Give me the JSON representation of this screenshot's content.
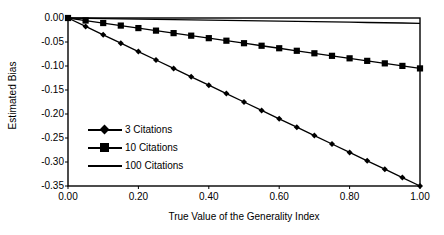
{
  "chart_data": {
    "type": "line",
    "title": "",
    "xlabel": "True Value of the Generality Index",
    "ylabel": "Estimated Bias",
    "xlim": [
      0.0,
      1.0
    ],
    "ylim": [
      -0.35,
      0.0
    ],
    "xticks": [
      "0.00",
      "0.20",
      "0.40",
      "0.60",
      "0.80",
      "1.00"
    ],
    "xtick_values": [
      0.0,
      0.2,
      0.4,
      0.6,
      0.8,
      1.0
    ],
    "yticks": [
      "0.00",
      "-0.05",
      "-0.10",
      "-0.15",
      "-0.20",
      "-0.25",
      "-0.30",
      "-0.35"
    ],
    "ytick_values": [
      0.0,
      -0.05,
      -0.1,
      -0.15,
      -0.2,
      -0.25,
      -0.3,
      -0.35
    ],
    "grid": false,
    "legend_position": "inside-lower-left",
    "x": [
      0.0,
      0.05,
      0.1,
      0.15,
      0.2,
      0.25,
      0.3,
      0.35,
      0.4,
      0.45,
      0.5,
      0.55,
      0.6,
      0.65,
      0.7,
      0.75,
      0.8,
      0.85,
      0.9,
      0.95,
      1.0
    ],
    "series": [
      {
        "name": "3 Citations",
        "marker": "diamond",
        "color": "#000000",
        "values": [
          0.0,
          -0.0175,
          -0.035,
          -0.0525,
          -0.07,
          -0.0875,
          -0.105,
          -0.1225,
          -0.14,
          -0.1575,
          -0.175,
          -0.1925,
          -0.21,
          -0.2275,
          -0.245,
          -0.2625,
          -0.28,
          -0.2975,
          -0.315,
          -0.3325,
          -0.35
        ]
      },
      {
        "name": "10 Citations",
        "marker": "square",
        "color": "#000000",
        "values": [
          0.0,
          -0.0053,
          -0.0105,
          -0.0158,
          -0.021,
          -0.0263,
          -0.0315,
          -0.0368,
          -0.042,
          -0.0473,
          -0.0525,
          -0.0578,
          -0.063,
          -0.0683,
          -0.0735,
          -0.0788,
          -0.084,
          -0.0893,
          -0.0945,
          -0.0998,
          -0.105
        ]
      },
      {
        "name": "100 Citations",
        "marker": "none",
        "color": "#000000",
        "values": [
          0.0,
          -0.00055,
          -0.0011,
          -0.00165,
          -0.0022,
          -0.00275,
          -0.0033,
          -0.00385,
          -0.0044,
          -0.00495,
          -0.0055,
          -0.00605,
          -0.0066,
          -0.00715,
          -0.0077,
          -0.00825,
          -0.0088,
          -0.00935,
          -0.0099,
          -0.01045,
          -0.011
        ]
      }
    ]
  },
  "legend": {
    "items": [
      {
        "label": "3 Citations"
      },
      {
        "label": "10 Citations"
      },
      {
        "label": "100 Citations"
      }
    ]
  }
}
